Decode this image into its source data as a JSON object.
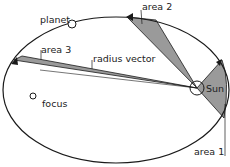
{
  "diagram": {
    "labels": {
      "planet": "planet",
      "area1": "area 1",
      "area2": "area 2",
      "area3": "area 3",
      "radius_vector": "radius vector",
      "focus": "focus",
      "sun": "Sun"
    },
    "colors": {
      "orbit": "#1a1a1a",
      "area_fill": "#9a9a9a",
      "background": "#ffffff"
    }
  }
}
